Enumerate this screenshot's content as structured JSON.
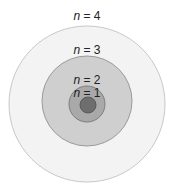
{
  "diagram": {
    "type": "concentric-shells",
    "center": [
      87,
      104
    ],
    "shells": [
      {
        "label_var": "n",
        "label_eq": " = 4",
        "radius": 78,
        "fill": "#f3f3f3",
        "stroke": "#c8c8c8",
        "label_y": 20
      },
      {
        "label_var": "n",
        "label_eq": " = 3",
        "radius": 45,
        "fill": "#cfcfcf",
        "stroke": "#9a9a9a",
        "label_y": 54
      },
      {
        "label_var": "n",
        "label_eq": " = 2",
        "radius": 18,
        "fill": "#a9a9a9",
        "stroke": "#7e7e7e",
        "label_y": 84
      },
      {
        "label_var": "n",
        "label_eq": " = 1",
        "radius": 8,
        "fill": "#6e6e6e",
        "stroke": "#5a5a5a",
        "label_y": 97
      }
    ]
  }
}
